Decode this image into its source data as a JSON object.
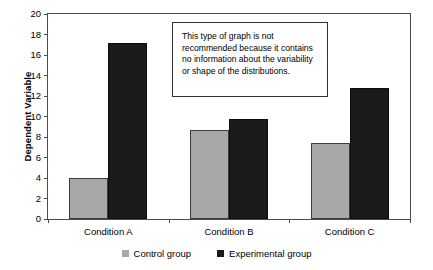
{
  "chart_data": {
    "type": "bar",
    "title": "",
    "xlabel": "",
    "ylabel": "Dependent Variable",
    "categories": [
      "Condition A",
      "Condition B",
      "Condition C"
    ],
    "series": [
      {
        "name": "Control group",
        "color": "#a8a8a8",
        "values": [
          4.0,
          8.7,
          7.4
        ]
      },
      {
        "name": "Experimental group",
        "color": "#1a1a1a",
        "values": [
          17.2,
          9.8,
          12.8
        ]
      }
    ],
    "ylim": [
      0,
      20
    ],
    "ytick_step": 2,
    "yticks": [
      "0",
      "2",
      "4",
      "6",
      "8",
      "10",
      "12",
      "14",
      "16",
      "18",
      "20"
    ],
    "grid": false,
    "legend_position": "bottom"
  },
  "annotation": {
    "text": "This type of graph is not recommended because it contains no information about the variability or shape of the distributions."
  },
  "legend": {
    "items": [
      {
        "label": "Control group"
      },
      {
        "label": "Experimental group"
      }
    ]
  },
  "colors": {
    "control": "#a8a8a8",
    "experimental": "#1a1a1a",
    "axis": "#4d4d4d",
    "text": "#000000"
  }
}
